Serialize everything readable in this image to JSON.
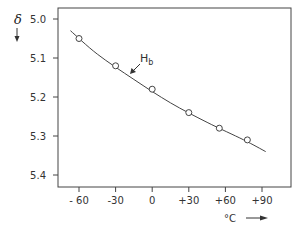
{
  "chart_data": {
    "type": "scatter",
    "title": "",
    "xlabel": "°C",
    "ylabel": "δ",
    "xlim": [
      -75,
      112
    ],
    "ylim": [
      4.97,
      5.43
    ],
    "y_inverted": true,
    "grid": false,
    "x_ticks": [
      -60,
      -30,
      0,
      30,
      60,
      90
    ],
    "x_tick_labels": [
      "- 60",
      "-30",
      "0",
      "+30",
      "+60",
      "+90"
    ],
    "y_ticks": [
      5.0,
      5.1,
      5.2,
      5.3,
      5.4
    ],
    "y_tick_labels": [
      "5.0",
      "5.1",
      "5.2",
      "5.3",
      "5.4"
    ],
    "series": [
      {
        "name": "H_b",
        "marker": "open-circle",
        "line": "fitted-curve",
        "x": [
          -60,
          -30,
          0,
          30,
          55,
          78
        ],
        "y": [
          5.05,
          5.12,
          5.18,
          5.24,
          5.28,
          5.31
        ]
      }
    ],
    "fit_curve": {
      "x": [
        -67,
        -45,
        -15,
        15,
        45,
        75,
        93
      ],
      "y": [
        5.03,
        5.09,
        5.155,
        5.215,
        5.265,
        5.31,
        5.34
      ]
    },
    "annotations": [
      {
        "text": "H",
        "subscript": "b",
        "arrow_to": [
          -42,
          5.115
        ]
      }
    ]
  },
  "labels": {
    "y_symbol": "δ",
    "y_arrow": "↓",
    "x_unit": "°C",
    "curve_name": "H",
    "curve_sub": "b"
  },
  "style": {
    "ink": "#333333",
    "frame": "#444444"
  }
}
